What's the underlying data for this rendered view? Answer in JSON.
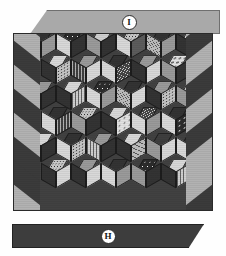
{
  "figure": {
    "kind": "quilt-photograph-figure"
  },
  "labels": {
    "top": {
      "letter": "I",
      "bar_color": "#a9a9a9",
      "text_color": "#141414"
    },
    "bottom": {
      "letter": "H",
      "bar_color": "#3d3d3d",
      "text_color": "#141414"
    }
  },
  "palette": {
    "background": "#ffffff",
    "panel_ground": "#414141",
    "border_dark": "#3a3a3a",
    "border_light": "#b4b4b4",
    "outline": "#2a2a2a"
  },
  "borders": {
    "left": {
      "name": "chevron-border-left",
      "stripes": [
        "#3b3b3b",
        "#b2b2b2",
        "#3b3b3b",
        "#b2b2b2",
        "#3b3b3b",
        "#b2b2b2",
        "#3b3b3b"
      ]
    },
    "right": {
      "name": "chevron-border-right",
      "stripes": [
        "#b2b2b2",
        "#3b3b3b",
        "#b2b2b2",
        "#3b3b3b",
        "#b2b2b2",
        "#3b3b3b",
        "#b2b2b2"
      ]
    }
  },
  "quilt": {
    "tiling": "rhombus-hexagon",
    "columns": 7,
    "rows": 6,
    "cells": [
      [
        "t-dk",
        "t-lt",
        "t-md",
        "t-spk",
        "t-lt",
        "t-dk",
        "t-grid",
        "t-md",
        "t-dk",
        "t-dot",
        "t-lt",
        "t-mdk",
        "t-dk",
        "t-diag",
        "t-md",
        "t-lt",
        "t-dk",
        "t-grid",
        "t-md",
        "t-lt",
        "t-dk"
      ],
      [
        "t-lt",
        "t-dk",
        "t-dot",
        "t-md",
        "t-gridd",
        "t-lt",
        "t-dk",
        "t-lt",
        "t-diagd",
        "t-md",
        "t-dk",
        "t-lt",
        "t-flor",
        "t-md",
        "t-dk",
        "t-dk",
        "t-dot",
        "t-lt",
        "t-lt",
        "t-mdk",
        "t-dk"
      ],
      [
        "t-md",
        "t-dot",
        "t-dk",
        "t-lt",
        "t-dk",
        "t-grid",
        "t-spk",
        "t-lt",
        "t-md",
        "t-dk",
        "t-diag",
        "t-lt",
        "t-md",
        "t-dk",
        "t-dot",
        "t-grid",
        "t-md",
        "t-dk",
        "t-dk",
        "t-lt",
        "t-md"
      ],
      [
        "t-dk",
        "t-lt",
        "t-gridd",
        "t-dot",
        "t-md",
        "t-dk",
        "t-lt",
        "t-dk",
        "t-flor",
        "t-diagd",
        "t-lt",
        "t-md",
        "t-dk",
        "t-lt",
        "t-spk",
        "t-md",
        "t-dk",
        "t-lt",
        "t-lt",
        "t-dk",
        "t-mdk"
      ],
      [
        "t-lt",
        "t-md",
        "t-dk",
        "t-dk",
        "t-lt",
        "t-dot",
        "t-md",
        "t-grid",
        "t-dk",
        "t-lt",
        "t-dk",
        "t-diag",
        "t-gridd",
        "t-md",
        "t-lt",
        "t-dk",
        "t-lt",
        "t-md",
        "t-md",
        "t-dot",
        "t-dk"
      ],
      [
        "t-dot",
        "t-dk",
        "t-lt",
        "t-md",
        "t-dk",
        "t-lt",
        "t-dk",
        "t-lt",
        "t-md",
        "t-spk",
        "t-md",
        "t-dk",
        "t-lt",
        "t-dk",
        "t-grid",
        "t-dk",
        "t-md",
        "t-lt",
        "t-dk",
        "t-lt",
        "t-dot"
      ]
    ]
  }
}
